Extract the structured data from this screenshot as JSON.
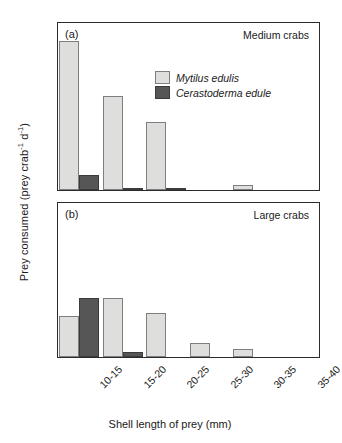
{
  "axes": {
    "y_title_main": "Prey consumed (prey crab",
    "y_title_sup1": "-1",
    "y_title_mid": " d",
    "y_title_sup2": "-1",
    "y_title_end": ")",
    "x_title": "Shell length of prey (mm)"
  },
  "legend": {
    "items": [
      {
        "label": "Mytilus edulis",
        "color": "#dededc"
      },
      {
        "label": "Cerastoderma edule",
        "color": "#565656"
      }
    ]
  },
  "panels": [
    {
      "tag": "(a)",
      "heading": "Medium crabs"
    },
    {
      "tag": "(b)",
      "heading": "Large crabs"
    }
  ],
  "chart_data": [
    {
      "type": "bar",
      "title": "Medium crabs",
      "panel": "(a)",
      "xlabel": "Shell length of prey (mm)",
      "ylabel": "Prey consumed (prey crab-1 d-1)",
      "categories": [
        "10-15",
        "15-20",
        "20-25",
        "25-30",
        "30-35",
        "35-40"
      ],
      "series": [
        {
          "name": "Mytilus edulis",
          "color": "#dededc",
          "values": [
            4.5,
            2.85,
            2.05,
            0,
            0.15,
            0
          ]
        },
        {
          "name": "Cerastoderma edule",
          "color": "#565656",
          "values": [
            0.45,
            0.05,
            0.05,
            0,
            0,
            0
          ]
        }
      ],
      "ylim": [
        0,
        5.05
      ],
      "yticks": [
        0,
        2,
        4
      ],
      "grid": false,
      "legend_position": "upper-right-inside"
    },
    {
      "type": "bar",
      "title": "Large crabs",
      "panel": "(b)",
      "xlabel": "Shell length of prey (mm)",
      "ylabel": "Prey consumed (prey crab-1 d-1)",
      "categories": [
        "10-15",
        "15-20",
        "20-25",
        "25-30",
        "30-35",
        "35-40"
      ],
      "series": [
        {
          "name": "Mytilus edulis",
          "color": "#dededc",
          "values": [
            1.35,
            1.95,
            1.45,
            0.45,
            0.25,
            0
          ]
        },
        {
          "name": "Cerastoderma edule",
          "color": "#565656",
          "values": [
            1.95,
            0.17,
            0,
            0,
            0,
            0
          ]
        }
      ],
      "ylim": [
        0,
        5.05
      ],
      "yticks": [
        0,
        2,
        4
      ],
      "grid": false,
      "legend_position": "none"
    }
  ]
}
